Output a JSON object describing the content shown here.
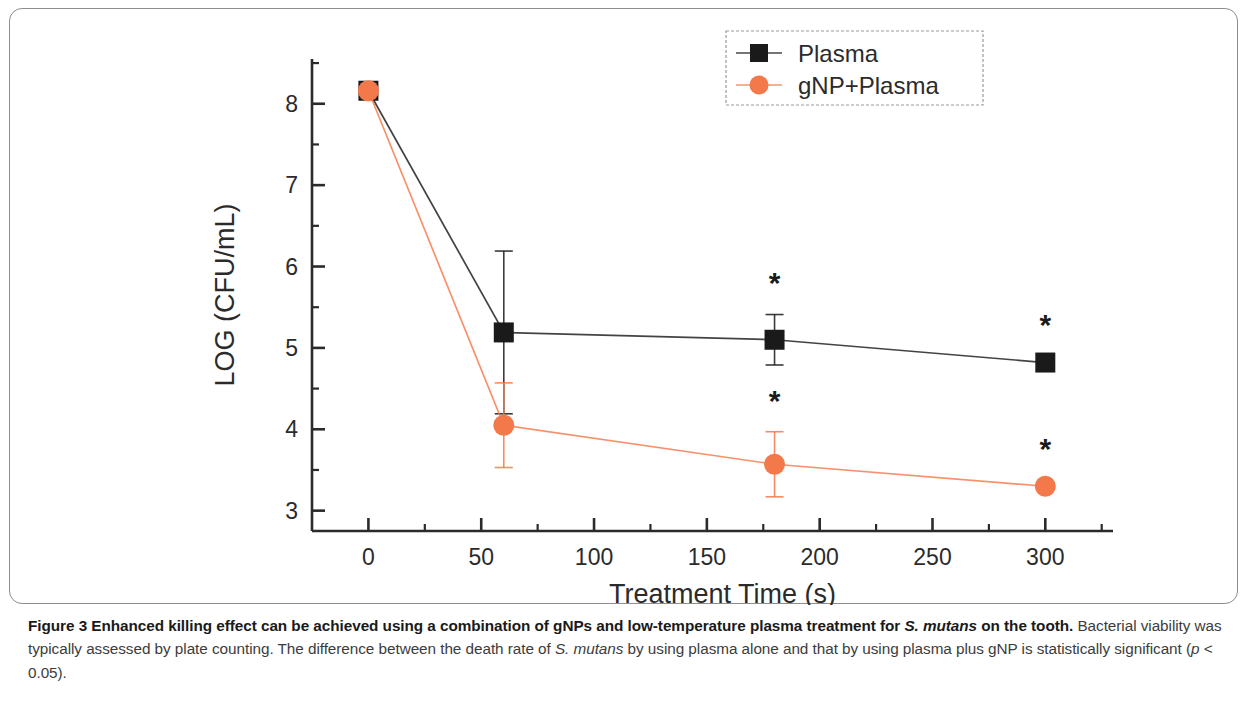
{
  "figure": {
    "caption": {
      "bold_lead_1": "Figure 3 Enhanced killing effect can be achieved using a combination of gNPs and low-temperature plasma treatment for ",
      "bold_italic_1": "S. mutans",
      "bold_lead_2": " on the tooth.",
      "body_1": " Bacterial viability was typically assessed by plate counting. The difference between the death rate of ",
      "italic_1": "S. mutans",
      "body_2": " by using plasma alone and that by using plasma plus gNP is statistically significant (",
      "italic_2": "p",
      "body_3": " < 0.05)."
    }
  },
  "chart_data": {
    "type": "line",
    "title": "",
    "xlabel": "Treatment Time (s)",
    "ylabel": "LOG (CFU/mL)",
    "xlim": [
      -25,
      330
    ],
    "ylim": [
      2.75,
      8.55
    ],
    "xticks": [
      0,
      50,
      100,
      150,
      200,
      250,
      300
    ],
    "xtick_labels": [
      "0",
      "50",
      "100",
      "150",
      "200",
      "250",
      "300"
    ],
    "yticks": [
      3,
      4,
      5,
      6,
      7,
      8
    ],
    "ytick_labels": [
      "3",
      "4",
      "5",
      "6",
      "7",
      "8"
    ],
    "minor_yticks": [
      3.5,
      4.5,
      5.5,
      6.5,
      7.5,
      8.5
    ],
    "minor_xticks": [
      25,
      75,
      125,
      175,
      225,
      275,
      325
    ],
    "grid": false,
    "legend_position": "top-right",
    "x": [
      0,
      60,
      180,
      300
    ],
    "series": [
      {
        "name": "Plasma",
        "marker": "square",
        "color": "#1a1a1a",
        "values": [
          8.16,
          5.19,
          5.1,
          4.82
        ],
        "errors": [
          0.05,
          1.0,
          0.31,
          0.1
        ]
      },
      {
        "name": "gNP+Plasma",
        "marker": "circle",
        "color": "#F4794A",
        "values": [
          8.16,
          4.05,
          3.57,
          3.3
        ],
        "errors": [
          0.05,
          0.52,
          0.4,
          0.05
        ]
      }
    ],
    "annotations": [
      {
        "text": "*",
        "x": 180,
        "y": 5.67,
        "series": "Plasma"
      },
      {
        "text": "*",
        "x": 300,
        "y": 5.16,
        "series": "Plasma"
      },
      {
        "text": "*",
        "x": 180,
        "y": 4.22,
        "series": "gNP+Plasma"
      },
      {
        "text": "*",
        "x": 300,
        "y": 3.64,
        "series": "gNP+Plasma"
      }
    ]
  },
  "legend": {
    "entries": [
      {
        "label": "Plasma",
        "marker": "square",
        "color": "#1a1a1a"
      },
      {
        "label": "gNP+Plasma",
        "marker": "circle",
        "color": "#F4794A"
      }
    ]
  }
}
